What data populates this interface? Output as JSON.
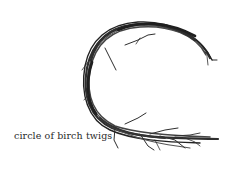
{
  "image": {
    "subject": "circle of birch twigs",
    "caption": "circle of birch twigs",
    "colors": {
      "background": "#ffffff",
      "twigs": "#2e2e2e",
      "caption": "#2a2a2a"
    }
  }
}
